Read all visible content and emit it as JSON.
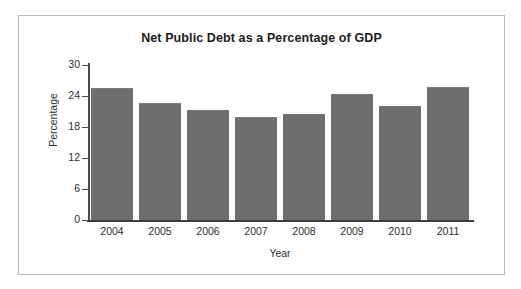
{
  "chart_data": {
    "type": "bar",
    "title": "Net Public Debt as a Percentage of GDP",
    "xlabel": "Year",
    "ylabel": "Percentage",
    "categories": [
      "2004",
      "2005",
      "2006",
      "2007",
      "2008",
      "2009",
      "2010",
      "2011"
    ],
    "values": [
      25.6,
      22.6,
      21.2,
      20.0,
      20.6,
      24.3,
      22.0,
      25.8
    ],
    "ylim": [
      0,
      30
    ],
    "yticks": [
      0,
      6,
      12,
      18,
      24,
      30
    ],
    "ytick_labels": [
      "0",
      "6",
      "12",
      "18",
      "24",
      "30"
    ],
    "grid": false,
    "legend": null,
    "bar_color": "#6e6e6e",
    "axis_color": "#3d3d3d",
    "text_color": "#2e2e2e",
    "title_color": "#1c1c1c",
    "frame_color": "#b8b8b8",
    "background": "#ffffff"
  }
}
